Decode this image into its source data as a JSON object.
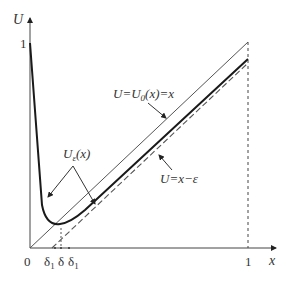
{
  "diagram": {
    "axes": {
      "y_label": "U",
      "x_label": "x",
      "y_tick": "1",
      "x_tick": "1",
      "origin": "0"
    },
    "x_ticks_small": [
      "δ",
      "δ",
      "δ"
    ],
    "x_ticks_sub": [
      "1",
      "",
      "1"
    ],
    "curves": {
      "upper_line": {
        "label_main": "U=U",
        "label_sub": "0",
        "label_rest": "(x)=x"
      },
      "dashed_line": {
        "label": "U=x−ε"
      },
      "solution": {
        "label_main": "U",
        "label_sub": "ε",
        "label_rest": "(x)"
      }
    },
    "colors": {
      "line": "#555555",
      "curve": "#1a1a1a",
      "text": "#333333"
    }
  }
}
